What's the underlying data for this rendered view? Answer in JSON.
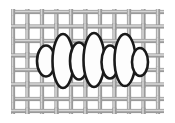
{
  "figure": {
    "title": "Woven mesh filter with trapped particles",
    "type": "technical-illustration",
    "width": 175,
    "height": 123,
    "background_color": "#ffffff"
  },
  "mesh": {
    "name": "woven-wire-mesh",
    "description": "Plain over-under woven screen of gray strands",
    "strand_color": "#9a9a9a",
    "strand_highlight_color": "#d6d6d6",
    "strand_shadow_color": "#6f6f6f",
    "strand_width": 4.2,
    "pitch": 14.5,
    "region": {
      "x": 11,
      "y": 9,
      "width": 153,
      "height": 105
    },
    "vertical_strand_x": [
      13,
      27.5,
      42,
      56.5,
      71,
      85.5,
      100,
      114.5,
      129,
      143.5,
      158
    ],
    "horizontal_strand_y": [
      12,
      26.5,
      41,
      55.5,
      70,
      84.5,
      99,
      111
    ]
  },
  "particles": {
    "name": "trapped-particle-chain",
    "description": "Horizontal chain of seven alternating white ellipses outlined in black",
    "fill_color": "#fdfdfd",
    "outline_color": "#1a1a1a",
    "outline_width": 2.6,
    "center_y": 61,
    "items": [
      {
        "label": "end-cap-left",
        "cx": 46,
        "cy": 61,
        "rx": 9,
        "ry": 15.5,
        "size": "small"
      },
      {
        "label": "particle-1",
        "cx": 63,
        "cy": 61,
        "rx": 10.5,
        "ry": 27,
        "size": "large"
      },
      {
        "label": "particle-2",
        "cx": 79,
        "cy": 61,
        "rx": 9,
        "ry": 18.5,
        "size": "medium"
      },
      {
        "label": "particle-3",
        "cx": 94,
        "cy": 60,
        "rx": 10.5,
        "ry": 27,
        "size": "large"
      },
      {
        "label": "particle-4",
        "cx": 110,
        "cy": 62,
        "rx": 8.5,
        "ry": 16.5,
        "size": "medium"
      },
      {
        "label": "particle-5",
        "cx": 125,
        "cy": 60,
        "rx": 10.5,
        "ry": 26,
        "size": "large"
      },
      {
        "label": "end-cap-right",
        "cx": 140,
        "cy": 62,
        "rx": 8,
        "ry": 14,
        "size": "small"
      }
    ]
  }
}
